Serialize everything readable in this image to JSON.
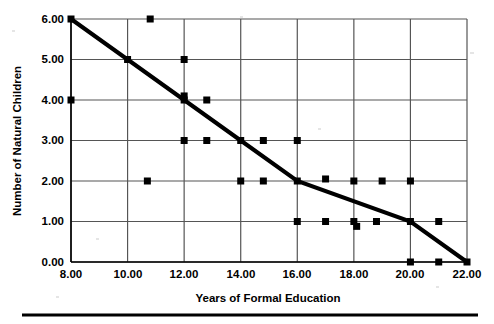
{
  "figure": {
    "background_color": "#ffffff",
    "ink_color": "#000000",
    "grid_color": "#555555",
    "width": 494,
    "height": 324,
    "bottom_rule": {
      "name": "bottom-horizontal-rule",
      "x1": 22,
      "x2": 478,
      "y": 315,
      "thickness": 3
    }
  },
  "chart_data": {
    "type": "scatter",
    "title": "",
    "subtitle": "",
    "xlabel": "Years of Formal Education",
    "ylabel": "Number of Natural Children",
    "xlim": [
      8,
      22
    ],
    "ylim": [
      0,
      6
    ],
    "xticks": [
      8,
      10,
      12,
      14,
      16,
      18,
      20,
      22
    ],
    "yticks": [
      0,
      1,
      2,
      3,
      4,
      5,
      6
    ],
    "xticklabels": [
      "8.00",
      "10.00",
      "12.00",
      "14.00",
      "16.00",
      "18.00",
      "20.00",
      "22.00"
    ],
    "yticklabels": [
      "0.00",
      "1.00",
      "2.00",
      "3.00",
      "4.00",
      "5.00",
      "6.00"
    ],
    "grid": true,
    "grid_axes": "both",
    "legend": null,
    "legend_position": "none",
    "marker": {
      "shape": "square",
      "color": "#000000",
      "size_px": 7
    },
    "series": [
      {
        "name": "Observations",
        "type": "scatter",
        "points": [
          [
            8.0,
            6.0
          ],
          [
            8.0,
            4.0
          ],
          [
            10.8,
            6.0
          ],
          [
            10.0,
            5.0
          ],
          [
            12.0,
            5.0
          ],
          [
            12.0,
            4.1
          ],
          [
            12.0,
            4.0
          ],
          [
            12.8,
            4.0
          ],
          [
            10.7,
            2.0
          ],
          [
            12.0,
            3.0
          ],
          [
            12.8,
            3.0
          ],
          [
            14.0,
            3.0
          ],
          [
            14.8,
            3.0
          ],
          [
            16.0,
            3.0
          ],
          [
            14.0,
            2.0
          ],
          [
            14.8,
            2.0
          ],
          [
            16.0,
            2.0
          ],
          [
            17.0,
            2.05
          ],
          [
            18.0,
            2.0
          ],
          [
            19.0,
            2.0
          ],
          [
            20.0,
            2.0
          ],
          [
            16.0,
            1.0
          ],
          [
            17.0,
            1.0
          ],
          [
            18.0,
            1.0
          ],
          [
            18.1,
            0.88
          ],
          [
            18.8,
            1.0
          ],
          [
            20.0,
            1.0
          ],
          [
            21.0,
            1.0
          ],
          [
            20.0,
            0.0
          ],
          [
            21.0,
            0.0
          ],
          [
            22.0,
            0.0
          ]
        ]
      },
      {
        "name": "Trend Line",
        "type": "line",
        "color": "#000000",
        "width_px": 4,
        "points": [
          [
            8.0,
            6.0
          ],
          [
            10.0,
            5.0
          ],
          [
            12.0,
            4.0
          ],
          [
            14.0,
            3.0
          ],
          [
            16.0,
            2.0
          ],
          [
            20.0,
            1.0
          ],
          [
            22.0,
            0.0
          ]
        ]
      }
    ]
  }
}
